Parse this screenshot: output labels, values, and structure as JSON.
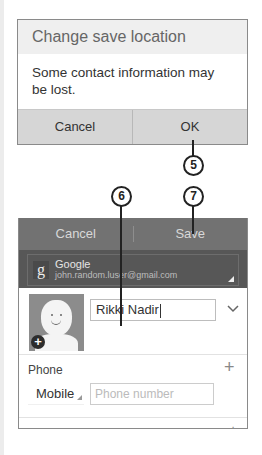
{
  "dialog": {
    "title": "Change save location",
    "message": "Some contact information may be lost.",
    "buttons": {
      "cancel": "Cancel",
      "ok": "OK"
    }
  },
  "callouts": {
    "c5": "5",
    "c6": "6",
    "c7": "7"
  },
  "editor": {
    "header": {
      "cancel": "Cancel",
      "save": "Save"
    },
    "account": {
      "icon": "g",
      "name": "Google",
      "email": "john.random.luser@gmail.com"
    },
    "name": {
      "value": "Rikki Nadir",
      "expand_icon": "⌄"
    },
    "phone": {
      "label": "Phone",
      "add_icon": "+",
      "type": "Mobile",
      "placeholder": "Phone number"
    },
    "email": {
      "label": "Email",
      "add_icon": "+"
    }
  },
  "colors": {
    "header_bg": "#727272",
    "account_bg": "#575757",
    "dialog_buttons_bg": "#d6d6d6",
    "dialog_title_bg": "#efefef"
  }
}
